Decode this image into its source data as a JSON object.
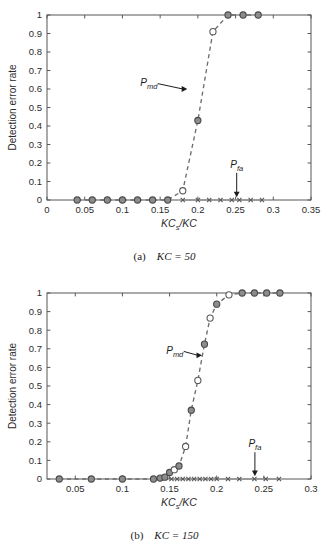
{
  "figure": {
    "name": "detection-error-rate-figure",
    "background": "#ffffff",
    "marker_fill": "#8c8c8c",
    "marker_stroke": "#4a4a4a",
    "curve_color": "#6e6e6e",
    "axis_color": "#575757"
  },
  "subfigures": [
    {
      "id": "a",
      "caption_tag": "(a)",
      "caption_math": "KC = 50",
      "caption_full": "(a)  KC = 50"
    },
    {
      "id": "b",
      "caption_tag": "(b)",
      "caption_math": "KC = 150",
      "caption_full": "(b)  KC = 150"
    }
  ],
  "chart_data": [
    {
      "type": "scatter",
      "subfigure": "a",
      "title": "",
      "xlabel": "KCs/KC",
      "xlabel_base": "KC",
      "xlabel_sub": "s",
      "xlabel_tail": "/KC",
      "ylabel": "Detection error rate",
      "xlim": [
        0,
        0.35
      ],
      "ylim": [
        0,
        1
      ],
      "xticks": [
        0,
        0.05,
        0.1,
        0.15,
        0.2,
        0.25,
        0.3,
        0.35
      ],
      "xtick_labels": [
        "0",
        "0.05",
        "0.1",
        "0.15",
        "0.2",
        "0.25",
        "0.3",
        "0.35"
      ],
      "yticks": [
        0,
        0.1,
        0.2,
        0.3,
        0.4,
        0.5,
        0.6,
        0.7,
        0.8,
        0.9,
        1
      ],
      "ytick_labels": [
        "0",
        "0.1",
        "0.2",
        "0.3",
        "0.4",
        "0.5",
        "0.6",
        "0.7",
        "0.8",
        "0.9",
        "1"
      ],
      "grid": false,
      "legend": "none",
      "series": [
        {
          "name": "Pmd",
          "label": "P_md",
          "marker": "circle-filled",
          "linestyle": "dashed",
          "x": [
            0.04,
            0.06,
            0.08,
            0.1,
            0.12,
            0.14,
            0.16,
            0.18,
            0.2,
            0.22,
            0.24,
            0.26,
            0.28
          ],
          "y": [
            0.0,
            0.0,
            0.0,
            0.0,
            0.0,
            0.0,
            0.0,
            0.05,
            0.43,
            0.91,
            1.0,
            1.0,
            1.0
          ]
        },
        {
          "name": "Pfa",
          "label": "P_fa",
          "marker": "cross",
          "linestyle": "solid",
          "x": [
            0.18,
            0.2,
            0.215,
            0.23,
            0.245,
            0.255,
            0.27,
            0.285
          ],
          "y": [
            0.0,
            0.0,
            0.0,
            0.0,
            0.0,
            0.0,
            0.0,
            0.0
          ]
        }
      ],
      "annotations": [
        {
          "name": "pmd-annotation",
          "text": "P",
          "sub": "md",
          "label_x": 0.135,
          "label_y": 0.615,
          "arrow_to_x": 0.186,
          "arrow_to_y": 0.6,
          "direction": "right"
        },
        {
          "name": "pfa-annotation",
          "text": "P",
          "sub": "fa",
          "label_x": 0.2515,
          "label_y": 0.175,
          "arrow_to_x": 0.2515,
          "arrow_to_y": 0.015,
          "direction": "down"
        }
      ]
    },
    {
      "type": "scatter",
      "subfigure": "b",
      "title": "",
      "xlabel": "KCs/KC",
      "xlabel_base": "KC",
      "xlabel_sub": "s",
      "xlabel_tail": "/KC",
      "ylabel": "Detection error rate",
      "xlim": [
        0.02,
        0.3
      ],
      "ylim": [
        0,
        1
      ],
      "xticks": [
        0.05,
        0.1,
        0.15,
        0.2,
        0.25,
        0.3
      ],
      "xtick_labels": [
        "0.05",
        "0.1",
        "0.15",
        "0.2",
        "0.25",
        "0.3"
      ],
      "yticks": [
        0,
        0.1,
        0.2,
        0.3,
        0.4,
        0.5,
        0.6,
        0.7,
        0.8,
        0.9,
        1
      ],
      "ytick_labels": [
        "0",
        "0.1",
        "0.2",
        "0.3",
        "0.4",
        "0.5",
        "0.6",
        "0.7",
        "0.8",
        "0.9",
        "1"
      ],
      "grid": false,
      "legend": "none",
      "series": [
        {
          "name": "Pmd",
          "label": "P_md",
          "marker": "circle-filled",
          "linestyle": "dashed",
          "x": [
            0.033,
            0.067,
            0.1,
            0.133,
            0.14,
            0.145,
            0.15,
            0.155,
            0.16,
            0.167,
            0.173,
            0.18,
            0.187,
            0.193,
            0.2,
            0.213,
            0.227,
            0.24,
            0.253,
            0.267
          ],
          "y": [
            0.0,
            0.0,
            0.0,
            0.0,
            0.005,
            0.01,
            0.035,
            0.05,
            0.07,
            0.175,
            0.37,
            0.53,
            0.725,
            0.865,
            0.94,
            0.99,
            1.0,
            1.0,
            1.0,
            1.0
          ]
        },
        {
          "name": "Pfa",
          "label": "P_fa",
          "marker": "cross",
          "linestyle": "solid",
          "x": [
            0.152,
            0.158,
            0.164,
            0.17,
            0.176,
            0.182,
            0.188,
            0.194,
            0.2,
            0.212,
            0.224,
            0.24,
            0.252,
            0.266
          ],
          "y": [
            0.0,
            0.0,
            0.0,
            0.0,
            0.0,
            0.0,
            0.0,
            0.0,
            0.0,
            0.0,
            0.0,
            0.0,
            0.0,
            0.0
          ]
        }
      ],
      "annotations": [
        {
          "name": "pmd-annotation",
          "text": "P",
          "sub": "md",
          "label_x": 0.1555,
          "label_y": 0.672,
          "arrow_to_x": 0.1845,
          "arrow_to_y": 0.665,
          "direction": "right"
        },
        {
          "name": "pfa-annotation",
          "text": "P",
          "sub": "fa",
          "label_x": 0.2405,
          "label_y": 0.172,
          "arrow_to_x": 0.2405,
          "arrow_to_y": 0.015,
          "direction": "down"
        }
      ]
    }
  ]
}
